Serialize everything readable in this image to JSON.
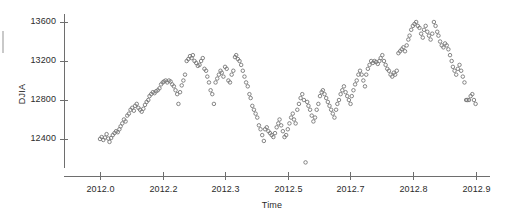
{
  "figure": {
    "width": 506,
    "height": 219,
    "background": "#ffffff",
    "marker_color": "#777777",
    "axis_color": "#6e6e6e",
    "text_color": "#2b2b2b"
  },
  "chart_data": {
    "type": "scatter",
    "title": "",
    "subtitle": "",
    "xlabel": "Time",
    "ylabel": "DJIA",
    "xlim": [
      2011.96,
      2012.93
    ],
    "ylim": [
      12100,
      13720
    ],
    "grid": false,
    "legend": null,
    "marker": "open-circle",
    "xticks": [
      2012.0,
      2012.2,
      2012.3,
      2012.5,
      2012.7,
      2012.8,
      2012.9
    ],
    "xticklabels": [
      "2012.0",
      "2012.2",
      "2012.3",
      "2012.5",
      "2012.7",
      "2012.8",
      "2012.9"
    ],
    "yticks": [
      12400,
      12800,
      13200,
      13600
    ],
    "yticklabels": [
      "12400",
      "12800",
      "13200",
      "13600"
    ],
    "x": [
      2012.0,
      2012.004,
      2012.008,
      2012.012,
      2012.016,
      2012.02,
      2012.023,
      2012.027,
      2012.031,
      2012.035,
      2012.039,
      2012.043,
      2012.047,
      2012.05,
      2012.054,
      2012.058,
      2012.062,
      2012.066,
      2012.07,
      2012.074,
      2012.078,
      2012.082,
      2012.085,
      2012.089,
      2012.093,
      2012.097,
      2012.101,
      2012.105,
      2012.109,
      2012.113,
      2012.117,
      2012.12,
      2012.124,
      2012.128,
      2012.132,
      2012.136,
      2012.14,
      2012.144,
      2012.148,
      2012.152,
      2012.155,
      2012.159,
      2012.163,
      2012.167,
      2012.171,
      2012.175,
      2012.179,
      2012.183,
      2012.187,
      2012.19,
      2012.194,
      2012.198,
      2012.202,
      2012.206,
      2012.21,
      2012.214,
      2012.218,
      2012.222,
      2012.225,
      2012.229,
      2012.233,
      2012.237,
      2012.241,
      2012.245,
      2012.249,
      2012.253,
      2012.257,
      2012.26,
      2012.264,
      2012.268,
      2012.272,
      2012.276,
      2012.28,
      2012.284,
      2012.288,
      2012.292,
      2012.295,
      2012.299,
      2012.303,
      2012.307,
      2012.311,
      2012.315,
      2012.319,
      2012.323,
      2012.327,
      2012.33,
      2012.334,
      2012.338,
      2012.342,
      2012.346,
      2012.35,
      2012.354,
      2012.358,
      2012.362,
      2012.365,
      2012.369,
      2012.373,
      2012.377,
      2012.381,
      2012.385,
      2012.389,
      2012.393,
      2012.397,
      2012.4,
      2012.404,
      2012.408,
      2012.412,
      2012.416,
      2012.42,
      2012.424,
      2012.428,
      2012.432,
      2012.435,
      2012.439,
      2012.443,
      2012.447,
      2012.451,
      2012.455,
      2012.459,
      2012.463,
      2012.467,
      2012.47,
      2012.474,
      2012.478,
      2012.482,
      2012.486,
      2012.49,
      2012.494,
      2012.498,
      2012.502,
      2012.505,
      2012.509,
      2012.513,
      2012.517,
      2012.521,
      2012.525,
      2012.529,
      2012.533,
      2012.537,
      2012.54,
      2012.544,
      2012.548,
      2012.552,
      2012.556,
      2012.56,
      2012.564,
      2012.568,
      2012.572,
      2012.575,
      2012.579,
      2012.583,
      2012.587,
      2012.591,
      2012.595,
      2012.599,
      2012.603,
      2012.607,
      2012.61,
      2012.614,
      2012.618,
      2012.622,
      2012.626,
      2012.63,
      2012.634,
      2012.638,
      2012.642,
      2012.645,
      2012.649,
      2012.653,
      2012.657,
      2012.661,
      2012.665,
      2012.669,
      2012.673,
      2012.677,
      2012.68,
      2012.684,
      2012.688,
      2012.692,
      2012.696,
      2012.7,
      2012.704,
      2012.708,
      2012.712,
      2012.715,
      2012.719,
      2012.723,
      2012.727,
      2012.731,
      2012.735,
      2012.739,
      2012.743,
      2012.747,
      2012.75,
      2012.754,
      2012.758,
      2012.762,
      2012.766,
      2012.77,
      2012.774,
      2012.778,
      2012.782,
      2012.785,
      2012.789,
      2012.793,
      2012.797,
      2012.801,
      2012.805,
      2012.809,
      2012.813,
      2012.817,
      2012.82,
      2012.824,
      2012.828,
      2012.832,
      2012.836,
      2012.84,
      2012.844,
      2012.848,
      2012.852,
      2012.855,
      2012.859,
      2012.863,
      2012.867,
      2012.871,
      2012.875,
      2012.879,
      2012.883,
      2012.887,
      2012.89,
      2012.894,
      2012.898,
      2012.902,
      2012.906,
      2012.91
    ],
    "y": [
      12400,
      12420,
      12390,
      12415,
      12450,
      12405,
      12370,
      12410,
      12440,
      12460,
      12480,
      12470,
      12500,
      12530,
      12560,
      12600,
      12580,
      12640,
      12660,
      12700,
      12720,
      12690,
      12740,
      12760,
      12720,
      12700,
      12680,
      12710,
      12750,
      12780,
      12800,
      12840,
      12860,
      12880,
      12870,
      12890,
      12900,
      12920,
      12960,
      12980,
      12990,
      13000,
      12980,
      13000,
      12990,
      12960,
      12940,
      12900,
      12860,
      12760,
      12880,
      12950,
      13000,
      13060,
      13200,
      13220,
      13250,
      13230,
      13260,
      13200,
      13180,
      13150,
      13160,
      13200,
      13230,
      13120,
      13100,
      13040,
      12980,
      12900,
      12860,
      12760,
      12980,
      13020,
      13060,
      13100,
      13080,
      13040,
      13140,
      13120,
      13000,
      12980,
      13060,
      13100,
      13240,
      13260,
      13220,
      13200,
      13160,
      13100,
      13040,
      12980,
      12940,
      12860,
      12820,
      12740,
      12700,
      12660,
      12620,
      12540,
      12500,
      12440,
      12380,
      12500,
      12520,
      12480,
      12460,
      12440,
      12420,
      12460,
      12520,
      12560,
      12600,
      12540,
      12480,
      12420,
      12440,
      12500,
      12560,
      12620,
      12660,
      12600,
      12560,
      12700,
      12760,
      12820,
      12860,
      12800,
      12160,
      12780,
      12740,
      12700,
      12640,
      12580,
      12620,
      12700,
      12760,
      12840,
      12880,
      12900,
      12860,
      12820,
      12780,
      12740,
      12700,
      12660,
      12620,
      12700,
      12760,
      12800,
      12860,
      12900,
      12940,
      12880,
      12840,
      12800,
      12760,
      12840,
      12900,
      12960,
      13000,
      13060,
      13100,
      13060,
      13000,
      12940,
      13060,
      13120,
      13160,
      13200,
      13180,
      13200,
      13190,
      13170,
      13200,
      13230,
      13260,
      13200,
      13160,
      13120,
      13100,
      13060,
      13040,
      13080,
      13060,
      13100,
      13280,
      13300,
      13320,
      13340,
      13300,
      13360,
      13420,
      13460,
      13520,
      13560,
      13580,
      13600,
      13560,
      13540,
      13480,
      13440,
      13520,
      13560,
      13500,
      13460,
      13420,
      13480,
      13600,
      13560,
      13500,
      13460,
      13400,
      13360,
      13340,
      13380,
      13360,
      13320,
      13260,
      13200,
      13140,
      13100,
      13060,
      13120,
      13160,
      13100,
      13040,
      12980,
      12800,
      12800,
      12800,
      12840,
      12860,
      12800,
      12760,
      12580,
      12820,
      12880,
      12940,
      13000,
      13040,
      13080,
      13100,
      13160,
      13200,
      13240,
      13260,
      13300,
      13320,
      13280,
      13240,
      13200,
      13180,
      13140,
      13100,
      13120,
      12960
    ]
  }
}
